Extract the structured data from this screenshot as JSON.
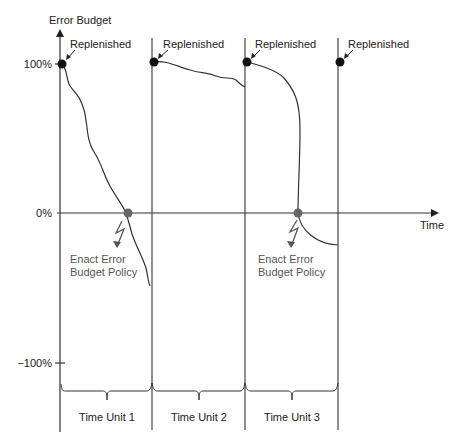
{
  "diagram": {
    "y_axis_label": "Error Budget",
    "x_axis_label": "Time",
    "y_ticks": {
      "top": "100%",
      "middle": "0%",
      "bottom": "−100%"
    },
    "replenished_labels": [
      "Replenished",
      "Replenished",
      "Replenished",
      "Replenished"
    ],
    "policy_labels": [
      {
        "line1": "Enact Error",
        "line2": "Budget Policy"
      },
      {
        "line1": "Enact Error",
        "line2": "Budget Policy"
      }
    ],
    "time_units": [
      "Time Unit 1",
      "Time Unit 2",
      "Time Unit 3"
    ],
    "colors": {
      "line": "#333333",
      "marker_replenished": "#111111",
      "marker_exhausted": "#666666",
      "policy_arrow": "#555555"
    },
    "markers": {
      "replenished_icon": "filled-circle",
      "exhausted_icon": "gray-circle",
      "policy_icon": "lightning-arrow"
    }
  }
}
